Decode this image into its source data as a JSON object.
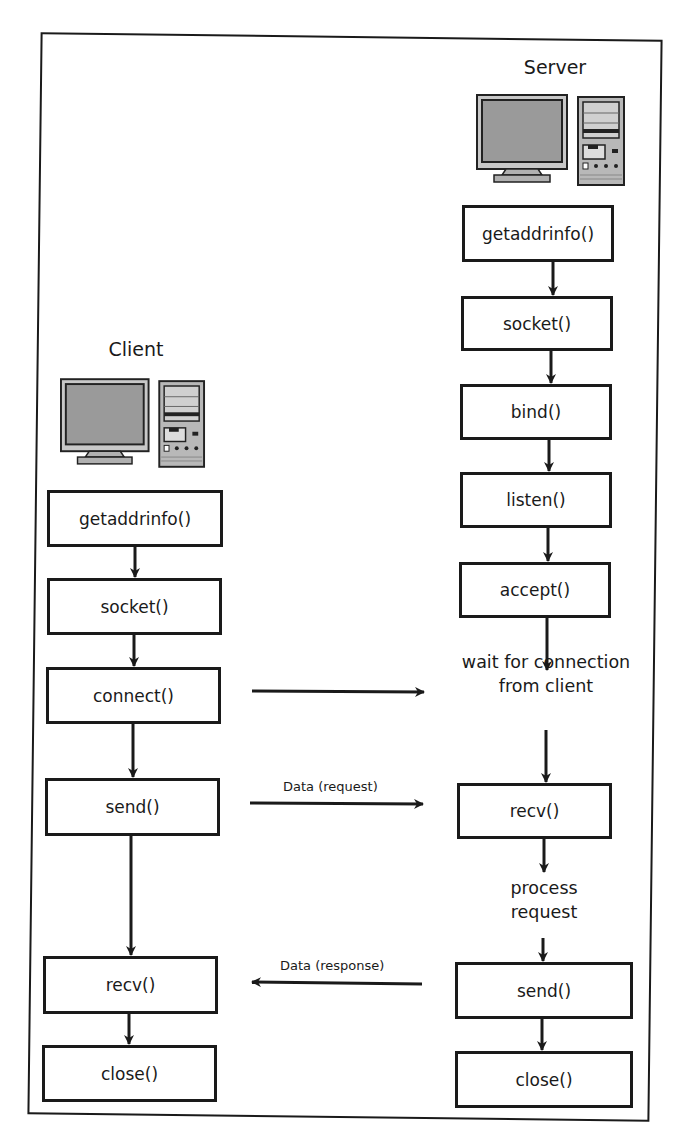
{
  "diagram": {
    "server": {
      "title": "Server",
      "icon": "desktop-computer-icon",
      "steps": [
        "getaddrinfo()",
        "socket()",
        "bind()",
        "listen()",
        "accept()"
      ],
      "wait_text_line1": "wait for connection",
      "wait_text_line2": "from client",
      "recv": "recv()",
      "process_line1": "process",
      "process_line2": "request",
      "send": "send()",
      "close": "close()"
    },
    "client": {
      "title": "Client",
      "icon": "desktop-computer-icon",
      "steps": [
        "getaddrinfo()",
        "socket()",
        "connect()",
        "send()",
        "recv()",
        "close()"
      ]
    },
    "messages": {
      "request": "Data (request)",
      "response": "Data (response)"
    },
    "colors": {
      "stroke": "#1a1a1a",
      "screen": "#9a9a9a",
      "background": "#ffffff"
    }
  }
}
